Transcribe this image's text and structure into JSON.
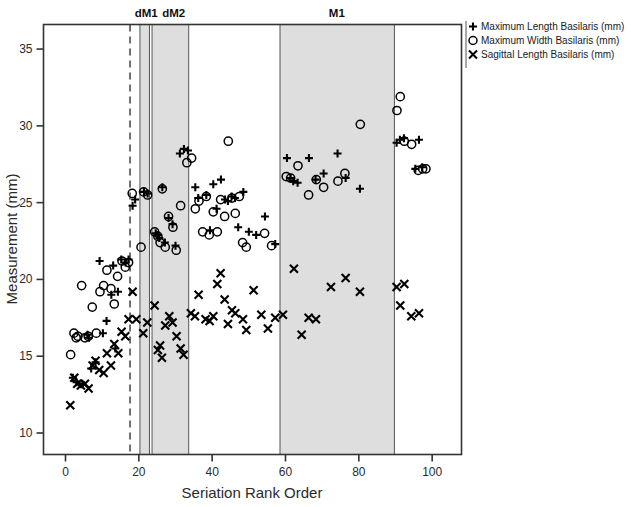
{
  "chart_data": {
    "type": "scatter",
    "title": "",
    "xlabel": "Seriation Rank Order",
    "ylabel": "Measurement (mm)",
    "xlim": [
      -6,
      108
    ],
    "ylim": [
      8.6,
      36.6
    ],
    "xticks": [
      0,
      20,
      40,
      60,
      80,
      100
    ],
    "yticks": [
      10,
      15,
      20,
      25,
      30,
      35
    ],
    "grid": false,
    "legend_position": "top-right",
    "annotations": [
      {
        "label": "dM1",
        "x": 22.0
      },
      {
        "label": "dM2",
        "x": 29.5
      },
      {
        "label": "M1",
        "x": 74.0
      }
    ],
    "bands": [
      {
        "name": "dM1",
        "x0": 20.3,
        "x1": 22.9,
        "color": "#dedede"
      },
      {
        "name": "dM2",
        "x0": 23.6,
        "x1": 33.6,
        "color": "#dedede"
      },
      {
        "name": "M1",
        "x0": 58.5,
        "x1": 89.7,
        "color": "#dedede"
      }
    ],
    "vlines": [
      {
        "x": 17.6,
        "style": "dashed",
        "color": "#333333"
      }
    ],
    "series": [
      {
        "name": "Maximum Length Basilaris (mm)",
        "marker": "plus",
        "points": [
          [
            2.0,
            13.6
          ],
          [
            3.0,
            13.3
          ],
          [
            4.6,
            13.2
          ],
          [
            6.0,
            16.4
          ],
          [
            6.4,
            16.2
          ],
          [
            7.0,
            14.2
          ],
          [
            8.2,
            14.6
          ],
          [
            9.3,
            21.2
          ],
          [
            10.2,
            16.5
          ],
          [
            11.2,
            17.3
          ],
          [
            12.5,
            19.0
          ],
          [
            13.0,
            20.9
          ],
          [
            13.6,
            15.5
          ],
          [
            14.3,
            19.2
          ],
          [
            15.2,
            21.3
          ],
          [
            16.4,
            21.1
          ],
          [
            17.2,
            21.3
          ],
          [
            18.3,
            24.8
          ],
          [
            19.0,
            25.2
          ],
          [
            21.4,
            25.7
          ],
          [
            22.4,
            25.6
          ],
          [
            24.6,
            23.0
          ],
          [
            25.2,
            22.9
          ],
          [
            25.6,
            22.7
          ],
          [
            26.4,
            26.0
          ],
          [
            27.1,
            22.4
          ],
          [
            28.1,
            24.0
          ],
          [
            29.2,
            23.6
          ],
          [
            30.0,
            22.2
          ],
          [
            31.2,
            28.2
          ],
          [
            32.3,
            28.5
          ],
          [
            33.4,
            28.4
          ],
          [
            35.4,
            26.0
          ],
          [
            36.2,
            25.3
          ],
          [
            38.4,
            25.5
          ],
          [
            39.4,
            23.2
          ],
          [
            40.3,
            26.2
          ],
          [
            41.2,
            24.6
          ],
          [
            42.4,
            26.5
          ],
          [
            43.5,
            25.2
          ],
          [
            44.3,
            25.1
          ],
          [
            45.3,
            25.4
          ],
          [
            46.2,
            25.3
          ],
          [
            47.1,
            23.4
          ],
          [
            48.5,
            25.7
          ],
          [
            50.0,
            23.1
          ],
          [
            52.0,
            22.9
          ],
          [
            54.4,
            24.1
          ],
          [
            57.2,
            22.3
          ],
          [
            60.4,
            27.9
          ],
          [
            61.4,
            26.6
          ],
          [
            62.1,
            26.4
          ],
          [
            63.3,
            26.3
          ],
          [
            66.4,
            27.9
          ],
          [
            68.2,
            26.5
          ],
          [
            70.4,
            26.9
          ],
          [
            74.2,
            28.2
          ],
          [
            76.4,
            26.6
          ],
          [
            80.3,
            25.9
          ],
          [
            90.3,
            28.9
          ],
          [
            91.2,
            29.1
          ],
          [
            92.3,
            29.2
          ],
          [
            95.4,
            27.2
          ],
          [
            96.4,
            29.1
          ],
          [
            97.3,
            27.3
          ]
        ]
      },
      {
        "name": "Maximum Width Basilaris (mm)",
        "marker": "circle",
        "points": [
          [
            1.4,
            15.1
          ],
          [
            2.3,
            16.5
          ],
          [
            2.9,
            16.2
          ],
          [
            3.4,
            16.3
          ],
          [
            4.4,
            19.6
          ],
          [
            5.3,
            16.2
          ],
          [
            6.2,
            16.3
          ],
          [
            7.3,
            18.2
          ],
          [
            8.4,
            16.5
          ],
          [
            9.4,
            19.2
          ],
          [
            10.4,
            19.6
          ],
          [
            11.3,
            20.6
          ],
          [
            12.4,
            19.4
          ],
          [
            13.3,
            18.4
          ],
          [
            14.2,
            20.2
          ],
          [
            15.4,
            21.2
          ],
          [
            16.3,
            20.8
          ],
          [
            17.2,
            21.1
          ],
          [
            18.2,
            25.6
          ],
          [
            20.6,
            22.1
          ],
          [
            21.3,
            25.7
          ],
          [
            22.4,
            25.5
          ],
          [
            24.3,
            23.1
          ],
          [
            25.2,
            22.8
          ],
          [
            25.8,
            22.4
          ],
          [
            26.4,
            25.9
          ],
          [
            27.2,
            22.1
          ],
          [
            28.1,
            24.1
          ],
          [
            29.3,
            23.4
          ],
          [
            30.2,
            21.9
          ],
          [
            31.4,
            24.8
          ],
          [
            33.1,
            27.6
          ],
          [
            34.4,
            27.9
          ],
          [
            35.4,
            24.6
          ],
          [
            36.4,
            25.1
          ],
          [
            37.4,
            23.1
          ],
          [
            38.4,
            25.4
          ],
          [
            39.2,
            22.9
          ],
          [
            40.3,
            24.4
          ],
          [
            41.4,
            23.1
          ],
          [
            42.3,
            25.2
          ],
          [
            43.4,
            24.1
          ],
          [
            44.4,
            29.0
          ],
          [
            45.4,
            25.3
          ],
          [
            46.3,
            24.3
          ],
          [
            47.4,
            25.4
          ],
          [
            48.3,
            22.4
          ],
          [
            49.3,
            22.1
          ],
          [
            54.3,
            23.0
          ],
          [
            56.2,
            22.2
          ],
          [
            60.2,
            26.7
          ],
          [
            61.4,
            26.6
          ],
          [
            63.4,
            27.4
          ],
          [
            66.3,
            25.5
          ],
          [
            68.4,
            26.5
          ],
          [
            70.4,
            26.0
          ],
          [
            74.3,
            26.4
          ],
          [
            76.2,
            26.9
          ],
          [
            80.4,
            30.1
          ],
          [
            90.4,
            31.0
          ],
          [
            91.3,
            31.9
          ],
          [
            92.4,
            29.0
          ],
          [
            94.4,
            28.8
          ],
          [
            96.2,
            27.1
          ],
          [
            97.4,
            27.2
          ],
          [
            98.3,
            27.2
          ]
        ]
      },
      {
        "name": "Sagittal Length Basilaris (mm)",
        "marker": "cross",
        "points": [
          [
            1.3,
            11.8
          ],
          [
            2.4,
            13.6
          ],
          [
            3.2,
            13.2
          ],
          [
            4.2,
            13.1
          ],
          [
            5.3,
            13.2
          ],
          [
            6.3,
            12.9
          ],
          [
            7.4,
            14.4
          ],
          [
            8.2,
            14.7
          ],
          [
            9.2,
            14.1
          ],
          [
            10.4,
            13.9
          ],
          [
            11.3,
            15.2
          ],
          [
            12.4,
            14.4
          ],
          [
            13.3,
            15.8
          ],
          [
            14.4,
            15.2
          ],
          [
            15.3,
            16.6
          ],
          [
            16.3,
            16.3
          ],
          [
            17.2,
            17.4
          ],
          [
            18.3,
            19.2
          ],
          [
            19.3,
            17.4
          ],
          [
            21.2,
            16.5
          ],
          [
            22.3,
            17.2
          ],
          [
            24.3,
            18.3
          ],
          [
            25.2,
            15.4
          ],
          [
            25.8,
            15.7
          ],
          [
            26.3,
            14.9
          ],
          [
            27.2,
            17.0
          ],
          [
            28.3,
            17.6
          ],
          [
            29.2,
            17.2
          ],
          [
            30.3,
            16.3
          ],
          [
            31.4,
            15.5
          ],
          [
            32.2,
            15.1
          ],
          [
            34.2,
            17.8
          ],
          [
            35.3,
            17.6
          ],
          [
            36.3,
            19.0
          ],
          [
            38.2,
            17.4
          ],
          [
            39.3,
            17.3
          ],
          [
            40.3,
            17.6
          ],
          [
            41.4,
            19.7
          ],
          [
            42.3,
            20.4
          ],
          [
            43.4,
            18.7
          ],
          [
            44.3,
            17.1
          ],
          [
            45.4,
            18.0
          ],
          [
            46.3,
            17.8
          ],
          [
            48.4,
            17.4
          ],
          [
            49.3,
            16.7
          ],
          [
            51.3,
            19.3
          ],
          [
            53.4,
            17.7
          ],
          [
            55.2,
            16.8
          ],
          [
            57.2,
            17.5
          ],
          [
            59.3,
            17.7
          ],
          [
            62.3,
            20.7
          ],
          [
            64.4,
            16.4
          ],
          [
            66.3,
            17.5
          ],
          [
            68.3,
            17.4
          ],
          [
            72.4,
            19.5
          ],
          [
            76.4,
            20.1
          ],
          [
            80.3,
            19.2
          ],
          [
            90.3,
            19.5
          ],
          [
            92.4,
            19.7
          ],
          [
            91.3,
            18.3
          ],
          [
            94.3,
            17.6
          ],
          [
            96.4,
            17.8
          ]
        ]
      }
    ]
  },
  "legend": {
    "items": [
      {
        "marker": "plus",
        "label": "Maximum Length Basilaris (mm)"
      },
      {
        "marker": "circle",
        "label": "Maximum Width Basilaris (mm)"
      },
      {
        "marker": "cross",
        "label": "Sagittal Length Basilaris (mm)"
      }
    ]
  }
}
